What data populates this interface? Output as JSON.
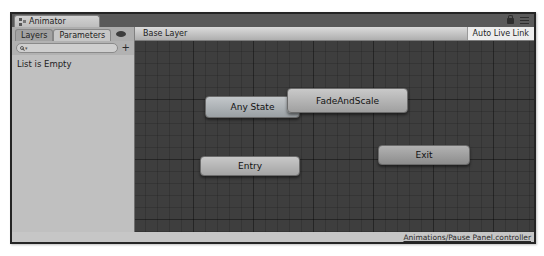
{
  "window": {
    "tab_title": "Animator"
  },
  "left_panel": {
    "tabs": [
      {
        "label": "Layers",
        "selected": false
      },
      {
        "label": "Parameters",
        "selected": true
      }
    ],
    "search": {
      "value": "",
      "add_button_label": "+"
    },
    "empty_message": "List is Empty"
  },
  "toolbar": {
    "breadcrumb": "Base Layer",
    "auto_live_link_label": "Auto Live Link"
  },
  "graph": {
    "nodes": [
      {
        "id": "any-state",
        "label": "Any State",
        "kind": "any",
        "x": 70,
        "y": 55,
        "w": 95,
        "h": 22
      },
      {
        "id": "fade-and-scale",
        "label": "FadeAndScale",
        "kind": "state",
        "x": 152,
        "y": 47,
        "w": 121,
        "h": 25
      },
      {
        "id": "entry",
        "label": "Entry",
        "kind": "entry",
        "x": 65,
        "y": 115,
        "w": 100,
        "h": 20
      },
      {
        "id": "exit",
        "label": "Exit",
        "kind": "exit",
        "x": 243,
        "y": 104,
        "w": 92,
        "h": 20
      }
    ]
  },
  "status_bar": {
    "controller_path": "Animations/Pause Panel.controller"
  },
  "colors": {
    "graph_background": "#3e3e3e",
    "panel_background": "#c2c2c2",
    "node_fill": "#b0b0b0",
    "tabbar_background": "#5a5a5a"
  }
}
